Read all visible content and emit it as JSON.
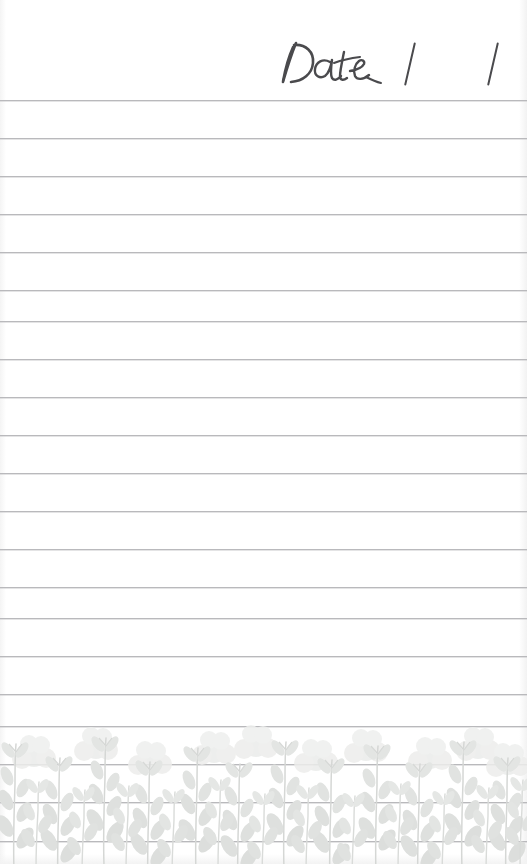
{
  "page": {
    "type": "lined-notepad-page",
    "width": 527,
    "height": 864,
    "background_color": "#ffffff"
  },
  "header": {
    "date_label": "Date",
    "date_label_style": "handwritten-script",
    "separator_1": "/",
    "separator_2": "/",
    "ink_color": "#4a4a4d"
  },
  "rules": {
    "count": 20,
    "first_y": 100,
    "spacing": 38,
    "color": "#b9b9bc",
    "thickness": 1,
    "positions": [
      100,
      138,
      176,
      214,
      252,
      290,
      321,
      359,
      397,
      435,
      473,
      511,
      549,
      587,
      618,
      656,
      694,
      726,
      764,
      802,
      841
    ]
  },
  "floral": {
    "name": "wildflower-botanical-border",
    "position": "bottom",
    "top_y": 714,
    "height": 150,
    "stem_color": "#d7d9d7",
    "leaf_color": "#dfe1df",
    "bloom_color": "#e9ebe9",
    "opacity": "soft-watercolor",
    "motif_count": 26
  }
}
